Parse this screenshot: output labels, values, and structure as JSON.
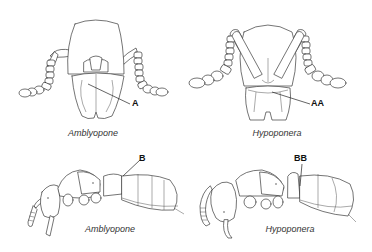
{
  "figure": {
    "panels": [
      {
        "id": "amblyopone-head",
        "view": "frontal head",
        "caption": "Amblyopone",
        "label": "A"
      },
      {
        "id": "hypoponera-head",
        "view": "frontal head",
        "caption": "Hypoponera",
        "label": "AA"
      },
      {
        "id": "amblyopone-body",
        "view": "lateral body",
        "caption": "Amblyopone",
        "label": "B"
      },
      {
        "id": "hypoponera-body",
        "view": "lateral body",
        "caption": "Hypoponera",
        "label": "BB"
      }
    ],
    "colors": {
      "background": "#ffffff",
      "line": "#3a3a3a",
      "text": "#333333"
    }
  }
}
